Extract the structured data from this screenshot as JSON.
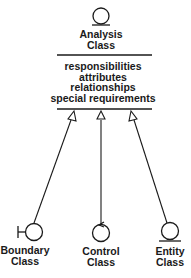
{
  "diagram": {
    "analysis_class": {
      "icon": "analysis-class-icon",
      "name_line1": "Analysis",
      "name_line2": "Class",
      "compartment": [
        "responsibilities",
        "attributes",
        "relationships",
        "special requirements"
      ]
    },
    "subclasses": [
      {
        "icon": "boundary-class-icon",
        "line1": "Boundary",
        "line2": "Class"
      },
      {
        "icon": "control-class-icon",
        "line1": "Control",
        "line2": "Class"
      },
      {
        "icon": "entity-class-icon",
        "line1": "Entity",
        "line2": "Class"
      }
    ],
    "relationship": "generalization",
    "colors": {
      "ink": "#1a1a1a",
      "background": "#ffffff"
    }
  }
}
